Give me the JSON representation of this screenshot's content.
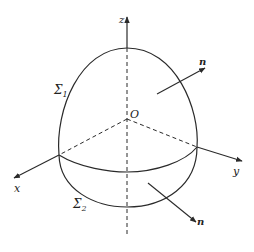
{
  "figure": {
    "type": "surface-of-revolution diagram",
    "colors": {
      "stroke": "#2a2a2a",
      "background": "#ffffff"
    },
    "axes": {
      "z_label": "z",
      "x_label": "x",
      "y_label": "y",
      "origin_label": "O"
    },
    "surfaces": {
      "upper_label": "Σ",
      "upper_sub": "1",
      "lower_label": "Σ",
      "lower_sub": "2"
    },
    "normals": {
      "upper_label": "n",
      "lower_label": "n"
    }
  }
}
